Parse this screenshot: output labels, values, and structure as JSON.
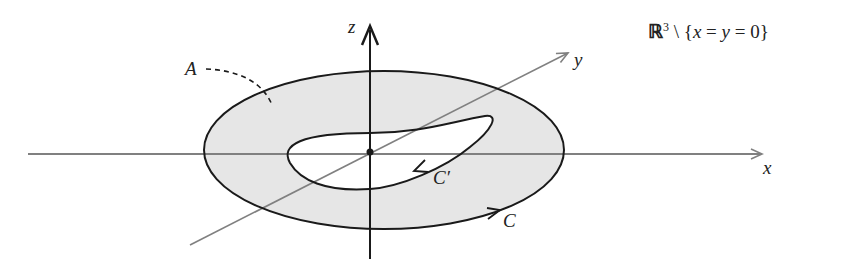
{
  "diagram": {
    "title": {
      "space": "ℝ",
      "exponent": "3",
      "rest_prefix": " \\ {",
      "x": "x",
      "eq1": " = ",
      "y": "y",
      "eq2": " = 0}"
    },
    "axes": {
      "x_label": "x",
      "y_label": "y",
      "z_label": "z"
    },
    "regions": {
      "annulus_label": "A"
    },
    "curves": {
      "outer_label": "C",
      "inner_label": "C′"
    },
    "colors": {
      "fill": "#e6e6e6",
      "curve": "#1a1a1a",
      "axis": "#808080",
      "z_axis": "#1a1a1a"
    }
  }
}
